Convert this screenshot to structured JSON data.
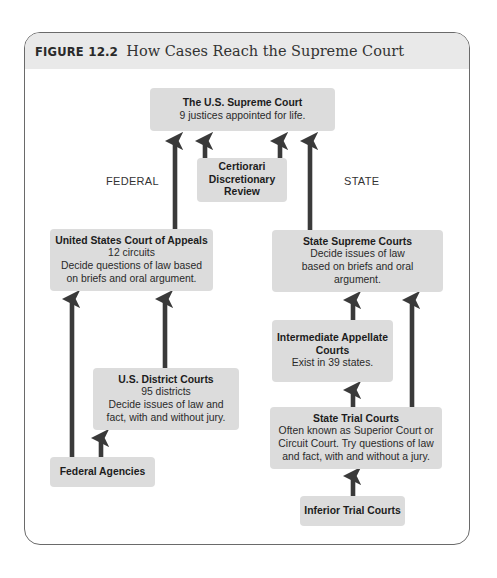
{
  "figure": {
    "label": "FIGURE",
    "number": "12.2",
    "title": "How Cases Reach the Supreme Court"
  },
  "labels": {
    "federal": "FEDERAL",
    "state": "STATE"
  },
  "nodes": {
    "supreme_court": {
      "title": "The U.S. Supreme Court",
      "lines": [
        "9 justices appointed for life."
      ]
    },
    "certiorari": {
      "title_lines": [
        "Certiorari",
        "Discretionary",
        "Review"
      ]
    },
    "court_of_appeals": {
      "title": "United States Court of Appeals",
      "lines": [
        "12 circuits",
        "Decide questions of law based",
        "on briefs and oral argument."
      ]
    },
    "state_supreme": {
      "title": "State Supreme Courts",
      "lines": [
        "Decide issues of law",
        "based on briefs and oral",
        "argument."
      ]
    },
    "intermediate_appellate": {
      "title_lines": [
        "Intermediate Appellate",
        "Courts"
      ],
      "lines": [
        "Exist in 39 states."
      ]
    },
    "district_courts": {
      "title": "U.S. District Courts",
      "lines": [
        "95 districts",
        "Decide issues of law and",
        "fact, with and without jury."
      ]
    },
    "state_trial": {
      "title": "State Trial Courts",
      "lines": [
        "Often known as Superior Court or",
        "Circuit Court. Try questions of law",
        "and fact, with and without a jury."
      ]
    },
    "federal_agencies": {
      "title": "Federal Agencies"
    },
    "inferior_trial": {
      "title": "Inferior Trial Courts"
    }
  },
  "edges": [
    {
      "from": "court_of_appeals",
      "to": "supreme_court"
    },
    {
      "from": "certiorari",
      "to": "supreme_court"
    },
    {
      "from": "certiorari",
      "to": "supreme_court"
    },
    {
      "from": "state_supreme",
      "to": "supreme_court"
    },
    {
      "from": "federal_agencies",
      "to": "court_of_appeals"
    },
    {
      "from": "district_courts",
      "to": "court_of_appeals"
    },
    {
      "from": "federal_agencies",
      "to": "district_courts"
    },
    {
      "from": "intermediate_appellate",
      "to": "state_supreme"
    },
    {
      "from": "state_trial",
      "to": "state_supreme"
    },
    {
      "from": "state_trial",
      "to": "intermediate_appellate"
    },
    {
      "from": "inferior_trial",
      "to": "state_trial"
    }
  ],
  "colors": {
    "box_fill": "#dcdcdc",
    "arrow": "#3a3a3a",
    "header_band": "#e9e9e9",
    "frame_border": "#6a6a6a"
  }
}
